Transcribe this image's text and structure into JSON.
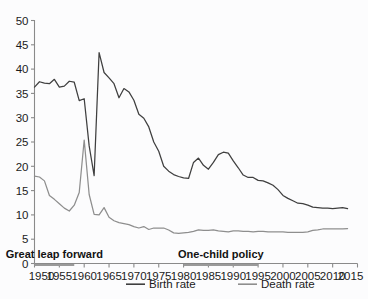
{
  "chart_data": {
    "type": "line",
    "title": "",
    "subtitle": "",
    "xlabel": "",
    "ylabel": "",
    "xlim": [
      1950,
      2015
    ],
    "ylim": [
      0,
      50
    ],
    "grid": false,
    "legend_position": "bottom",
    "x_ticks": [
      1950,
      1955,
      1960,
      1965,
      1970,
      1975,
      1980,
      1985,
      1990,
      1995,
      2000,
      2005,
      2010,
      2015
    ],
    "y_ticks": [
      0,
      5,
      10,
      15,
      20,
      25,
      30,
      35,
      40,
      45,
      50
    ],
    "x": [
      1950,
      1951,
      1952,
      1953,
      1954,
      1955,
      1956,
      1957,
      1958,
      1959,
      1960,
      1961,
      1962,
      1963,
      1964,
      1965,
      1966,
      1967,
      1968,
      1969,
      1970,
      1971,
      1972,
      1973,
      1974,
      1975,
      1976,
      1977,
      1978,
      1979,
      1980,
      1981,
      1982,
      1983,
      1984,
      1985,
      1986,
      1987,
      1988,
      1989,
      1990,
      1991,
      1992,
      1993,
      1994,
      1995,
      1996,
      1997,
      1998,
      1999,
      2000,
      2001,
      2002,
      2003,
      2004,
      2005,
      2006,
      2007,
      2008,
      2009,
      2010,
      2011,
      2012,
      2013
    ],
    "series": [
      {
        "name": "Birth rate",
        "color": "#3f3f3f",
        "values": [
          36.3,
          37.4,
          37.1,
          37.0,
          37.9,
          36.3,
          36.5,
          37.5,
          37.3,
          33.5,
          33.9,
          24.2,
          18.1,
          43.4,
          39.3,
          38.2,
          37.0,
          34.1,
          36.0,
          35.3,
          33.6,
          30.7,
          29.9,
          28.1,
          25.0,
          23.1,
          20.0,
          19.0,
          18.3,
          17.9,
          17.6,
          17.5,
          20.8,
          21.7,
          20.2,
          19.4,
          20.8,
          22.4,
          22.9,
          22.7,
          21.1,
          19.7,
          18.2,
          17.7,
          17.7,
          17.1,
          17.0,
          16.6,
          16.1,
          15.2,
          14.0,
          13.4,
          12.9,
          12.4,
          12.3,
          12.0,
          11.6,
          11.5,
          11.4,
          11.4,
          11.3,
          11.4,
          11.5,
          11.3
        ]
      },
      {
        "name": "Death rate",
        "color": "#8e8e8e",
        "values": [
          18.0,
          17.8,
          17.0,
          14.0,
          13.2,
          12.3,
          11.4,
          10.8,
          12.0,
          14.6,
          25.4,
          14.2,
          10.1,
          10.0,
          11.5,
          9.5,
          8.8,
          8.4,
          8.2,
          8.0,
          7.6,
          7.3,
          7.6,
          7.0,
          7.3,
          7.3,
          7.3,
          6.9,
          6.3,
          6.2,
          6.3,
          6.4,
          6.6,
          6.9,
          6.8,
          6.8,
          6.9,
          6.7,
          6.6,
          6.5,
          6.7,
          6.7,
          6.6,
          6.6,
          6.5,
          6.6,
          6.6,
          6.5,
          6.5,
          6.5,
          6.5,
          6.4,
          6.4,
          6.4,
          6.4,
          6.5,
          6.8,
          6.9,
          7.1,
          7.1,
          7.1,
          7.1,
          7.1,
          7.2
        ]
      }
    ],
    "annotations": [
      {
        "label": "Great leap forward",
        "x_start": 1950,
        "x_end": 1958
      },
      {
        "label": "One-child policy",
        "x_start": 1980,
        "x_end": 1995
      }
    ]
  },
  "axis": {
    "y_tick_labels": [
      "0",
      "5",
      "10",
      "15",
      "20",
      "25",
      "30",
      "35",
      "40",
      "45",
      "50"
    ],
    "x_tick_labels": [
      "1950",
      "1955",
      "1960",
      "1965",
      "1970",
      "1975",
      "1980",
      "1985",
      "1990",
      "1995",
      "2000",
      "2005",
      "2010",
      "2015"
    ],
    "axis_color": "#8a8a8a"
  },
  "legend": {
    "entries": [
      {
        "label": "Birth rate",
        "color": "#3f3f3f"
      },
      {
        "label": "Death rate",
        "color": "#8e8e8e"
      }
    ]
  },
  "annotations": {
    "great_leap_forward": "Great leap forward",
    "one_child_policy": "One-child policy"
  },
  "colors": {
    "background": "#fcfcfd",
    "birth_rate": "#3f3f3f",
    "death_rate": "#8e8e8e",
    "axis": "#8a8a8a",
    "text": "#1b1b1b"
  }
}
